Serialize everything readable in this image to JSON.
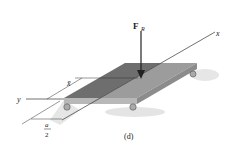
{
  "figure": {
    "caption": "(d)",
    "force_label": "F",
    "force_subscript": "R",
    "axis_x_label": "x",
    "axis_y_label": "y",
    "dim_xbar_label": "x̄",
    "dim_a_numerator": "a",
    "dim_a_denominator": "2"
  },
  "colors": {
    "plate_top_left": "#6e6e6e",
    "plate_top_right": "#9a9a9a",
    "plate_front": "#b4b4b4",
    "plate_side": "#8a8a8a",
    "line": "#333333",
    "shadow": "#d8d8d8"
  }
}
